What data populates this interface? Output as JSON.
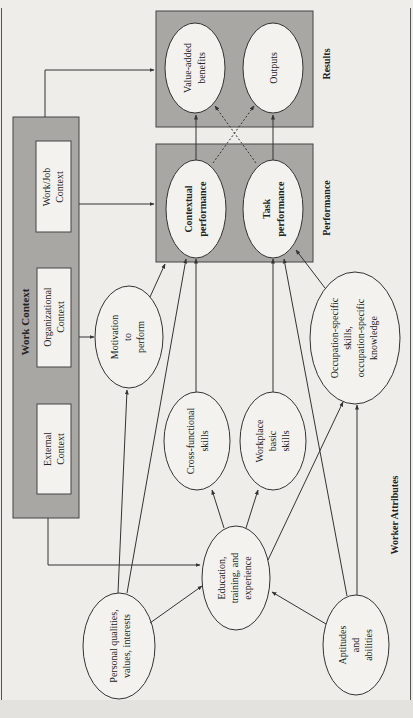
{
  "diagram": {
    "orientation": "rotated-90-ccw",
    "colors": {
      "panel_fill": "#a9a7a4",
      "node_fill": "#f3f2ef",
      "stroke": "#333333",
      "page": "#efedea"
    },
    "groups": {
      "work_context": {
        "title": "Work Context"
      },
      "results": {
        "title": "Results"
      },
      "performance": {
        "title": "Performance"
      },
      "worker_attributes": {
        "title": "Worker Attributes"
      }
    },
    "context_boxes": {
      "work_job": {
        "line1": "Work/Job",
        "line2": "Context"
      },
      "organizational": {
        "line1": "Organizational",
        "line2": "Context"
      },
      "external": {
        "line1": "External",
        "line2": "Context"
      }
    },
    "nodes": {
      "value_added": {
        "line1": "Value-added",
        "line2": "benefits"
      },
      "outputs": {
        "line1": "Outputs"
      },
      "contextual": {
        "line1": "Contextual",
        "line2": "performance"
      },
      "task": {
        "line1": "Task",
        "line2": "performance"
      },
      "motivation": {
        "line1": "Motivation",
        "line2": "to",
        "line3": "perform"
      },
      "cross_functional": {
        "line1": "Cross-functional",
        "line2": "skills"
      },
      "workplace_basic": {
        "line1": "Workplace",
        "line2": "basic",
        "line3": "skills"
      },
      "occupation_specific": {
        "line1": "Occupation-specific",
        "line2": "skills,",
        "line3": "occupation-specific",
        "line4": "knowledge"
      },
      "education": {
        "line1": "Education,",
        "line2": "training, and",
        "line3": "experience"
      },
      "personal": {
        "line1": "Personal qualities,",
        "line2": "values, interests"
      },
      "aptitudes": {
        "line1": "Aptitudes",
        "line2": "and",
        "line3": "abilities"
      }
    },
    "edges": [
      {
        "from": "Work/Job Context",
        "to": "Results",
        "style": "solid"
      },
      {
        "from": "Work/Job Context",
        "to": "Performance",
        "style": "solid"
      },
      {
        "from": "Organizational Context",
        "to": "Motivation to perform",
        "style": "solid"
      },
      {
        "from": "Work Context",
        "to": "Education, training, and experience",
        "style": "solid"
      },
      {
        "from": "Contextual performance",
        "to": "Value-added benefits",
        "style": "solid"
      },
      {
        "from": "Task performance",
        "to": "Outputs",
        "style": "solid"
      },
      {
        "from": "Contextual performance",
        "to": "Outputs",
        "style": "dashed"
      },
      {
        "from": "Task performance",
        "to": "Value-added benefits",
        "style": "dashed"
      },
      {
        "from": "Motivation to perform",
        "to": "Performance",
        "style": "solid"
      },
      {
        "from": "Personal qualities, values, interests",
        "to": "Motivation to perform",
        "style": "solid"
      },
      {
        "from": "Personal qualities, values, interests",
        "to": "Contextual performance",
        "style": "solid"
      },
      {
        "from": "Personal qualities, values, interests",
        "to": "Education, training, and experience",
        "style": "solid"
      },
      {
        "from": "Cross-functional skills",
        "to": "Contextual performance",
        "style": "solid"
      },
      {
        "from": "Workplace basic skills",
        "to": "Task performance",
        "style": "solid"
      },
      {
        "from": "Occupation-specific skills, occupation-specific knowledge",
        "to": "Task performance",
        "style": "solid"
      },
      {
        "from": "Education, training, and experience",
        "to": "Cross-functional skills",
        "style": "solid"
      },
      {
        "from": "Education, training, and experience",
        "to": "Workplace basic skills",
        "style": "solid"
      },
      {
        "from": "Education, training, and experience",
        "to": "Occupation-specific skills, occupation-specific knowledge",
        "style": "solid"
      },
      {
        "from": "Aptitudes and abilities",
        "to": "Education, training, and experience",
        "style": "solid"
      },
      {
        "from": "Aptitudes and abilities",
        "to": "Task performance",
        "style": "solid"
      },
      {
        "from": "Aptitudes and abilities",
        "to": "Occupation-specific skills, occupation-specific knowledge",
        "style": "solid"
      }
    ]
  }
}
